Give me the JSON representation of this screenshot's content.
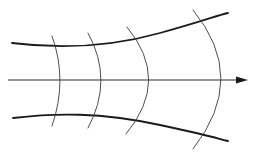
{
  "diagram": {
    "colors": {
      "background": "#ffffff",
      "boundary": "#1a1a1a",
      "wavefront": "#3a3a3a",
      "axis": "#2a2a2a"
    },
    "boundaries": [
      {
        "name": "upper-boundary",
        "path": "M12,43 C60,49 110,47 160,33 S215,16 228,13"
      },
      {
        "name": "lower-boundary",
        "path": "M13,118 C55,113 100,112 160,125 S215,138 228,141"
      }
    ],
    "axis": {
      "x1": 8,
      "y": 80,
      "x2": 240,
      "arrow_tip": 248
    },
    "wavefronts": [
      {
        "name": "wavefront-1",
        "path": "M52,36 Q68,80 52,126"
      },
      {
        "name": "wavefront-2",
        "path": "M88,33 Q114,80 88,128"
      },
      {
        "name": "wavefront-3",
        "path": "M127,27 Q171,80 126,134"
      },
      {
        "name": "wavefront-4",
        "path": "M193,10 Q249,78 193,149"
      }
    ]
  }
}
